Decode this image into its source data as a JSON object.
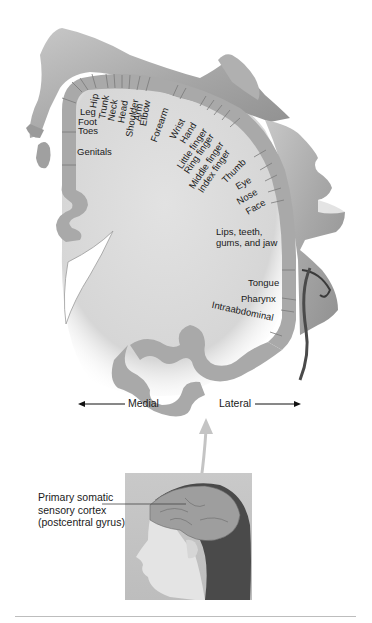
{
  "figure": {
    "colors": {
      "cortex_band": "#a9a9a9",
      "cortex_segment_lines": "#7a7a7a",
      "white_matter": "#d9d9d9",
      "homunculus_skin": "#b8b8b8",
      "text": "#1a1a1a",
      "rule": "#bdbdbd"
    },
    "body_region_labels": [
      {
        "id": "hip",
        "label": "Hip"
      },
      {
        "id": "trunk",
        "label": "Trunk"
      },
      {
        "id": "neck",
        "label": "Neck"
      },
      {
        "id": "head",
        "label": "Head"
      },
      {
        "id": "shoulder",
        "label": "Shoulder"
      },
      {
        "id": "arm",
        "label": "Arm"
      },
      {
        "id": "elbow",
        "label": "Elbow"
      },
      {
        "id": "forearm",
        "label": "Forearm"
      },
      {
        "id": "wrist",
        "label": "Wrist"
      },
      {
        "id": "hand",
        "label": "Hand"
      },
      {
        "id": "little-finger",
        "label": "Little finger"
      },
      {
        "id": "ring-finger",
        "label": "Ring finger"
      },
      {
        "id": "middle-finger",
        "label": "Middle finger"
      },
      {
        "id": "index-finger",
        "label": "Index finger"
      },
      {
        "id": "thumb",
        "label": "Thumb"
      },
      {
        "id": "eye",
        "label": "Eye"
      },
      {
        "id": "nose",
        "label": "Nose"
      },
      {
        "id": "face",
        "label": "Face"
      },
      {
        "id": "lips",
        "label": "Lips, teeth,"
      },
      {
        "id": "lips2",
        "label": "gums, and jaw"
      },
      {
        "id": "tongue",
        "label": "Tongue"
      },
      {
        "id": "pharynx",
        "label": "Pharynx"
      },
      {
        "id": "intraabdominal",
        "label": "Intraabdominal"
      },
      {
        "id": "leg",
        "label": "Leg"
      },
      {
        "id": "foot",
        "label": "Foot"
      },
      {
        "id": "toes",
        "label": "Toes"
      },
      {
        "id": "genitals",
        "label": "Genitals"
      }
    ],
    "direction_labels": {
      "medial": "Medial",
      "lateral": "Lateral"
    },
    "caption": {
      "line1": "Primary somatic",
      "line2": "sensory cortex",
      "line3": "(postcentral gyrus)"
    }
  }
}
